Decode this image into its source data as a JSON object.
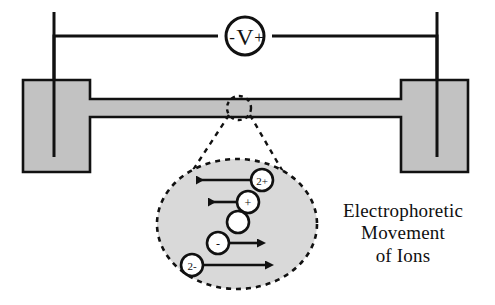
{
  "figure": {
    "type": "electrophoresis-apparatus-diagram",
    "caption_lines": [
      "Electrophoretic",
      "Movement",
      "of Ions"
    ],
    "colors": {
      "gel_fill": "#c2c2c2",
      "outline": "#111111",
      "bubble_fill": "#d9d9d9",
      "ion_fill": "#ffffff",
      "background": "#ffffff"
    }
  },
  "power_supply": {
    "label": "- V +",
    "negative_terminal": "-",
    "symbol": "V",
    "positive_terminal": "+",
    "negative_side": "left",
    "positive_side": "right"
  },
  "apparatus": {
    "left_reservoir_label": "",
    "right_reservoir_label": "",
    "channel_label": "",
    "left_electrode_label": "",
    "right_electrode_label": ""
  },
  "magnifier": {
    "source_label": "",
    "bubble_label": ""
  },
  "ions": [
    {
      "id": "ion-2plus",
      "charge_label": "2+",
      "direction": "left",
      "arrow_length": 62,
      "mobility": "high",
      "cx": 262,
      "cy": 180
    },
    {
      "id": "ion-plus",
      "charge_label": "+",
      "direction": "left",
      "arrow_length": 35,
      "mobility": "medium",
      "cx": 248,
      "cy": 202
    },
    {
      "id": "ion-neutral",
      "charge_label": "",
      "direction": "none",
      "arrow_length": 0,
      "mobility": "none",
      "cx": 238,
      "cy": 222
    },
    {
      "id": "ion-minus",
      "charge_label": "-",
      "direction": "right",
      "arrow_length": 35,
      "mobility": "medium",
      "cx": 218,
      "cy": 243
    },
    {
      "id": "ion-2minus",
      "charge_label": "2-",
      "direction": "right",
      "arrow_length": 70,
      "mobility": "high",
      "cx": 192,
      "cy": 265
    }
  ]
}
